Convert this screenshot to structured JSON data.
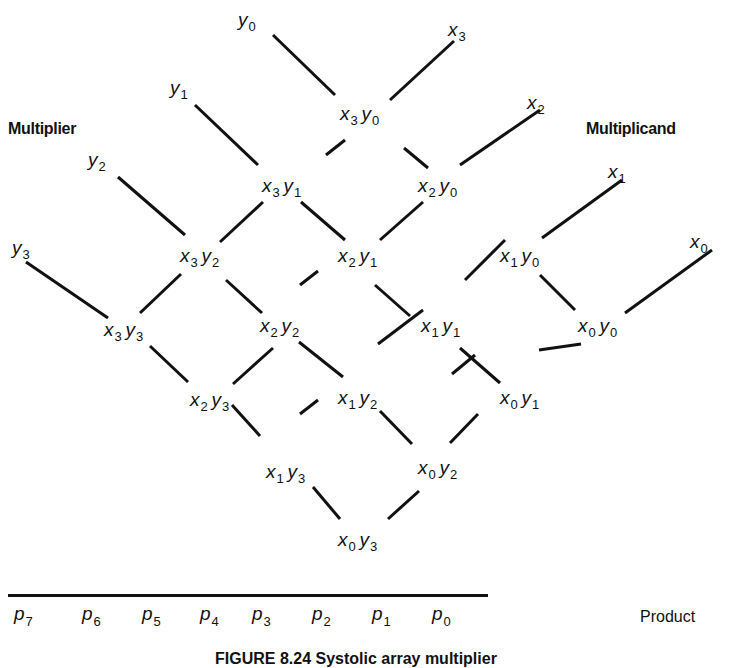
{
  "labels": {
    "multiplier": "Multiplier",
    "multiplicand": "Multiplicand",
    "product": "Product"
  },
  "caption": "FIGURE 8.24  Systolic array multiplier",
  "inputs_y": [
    {
      "base": "y",
      "sub": "0",
      "x": 238,
      "y": 10
    },
    {
      "base": "y",
      "sub": "1",
      "x": 170,
      "y": 78
    },
    {
      "base": "y",
      "sub": "2",
      "x": 88,
      "y": 150
    },
    {
      "base": "y",
      "sub": "3",
      "x": 12,
      "y": 238
    }
  ],
  "inputs_x": [
    {
      "base": "x",
      "sub": "3",
      "x": 448,
      "y": 20
    },
    {
      "base": "x",
      "sub": "2",
      "x": 527,
      "y": 93
    },
    {
      "base": "x",
      "sub": "1",
      "x": 608,
      "y": 162
    },
    {
      "base": "x",
      "sub": "0",
      "x": 690,
      "y": 232
    }
  ],
  "cells": [
    {
      "a": "3",
      "b": "0",
      "x": 340,
      "y": 104
    },
    {
      "a": "3",
      "b": "1",
      "x": 262,
      "y": 176
    },
    {
      "a": "2",
      "b": "0",
      "x": 418,
      "y": 176
    },
    {
      "a": "3",
      "b": "2",
      "x": 180,
      "y": 246
    },
    {
      "a": "2",
      "b": "1",
      "x": 338,
      "y": 246
    },
    {
      "a": "1",
      "b": "0",
      "x": 500,
      "y": 246
    },
    {
      "a": "3",
      "b": "3",
      "x": 104,
      "y": 320
    },
    {
      "a": "2",
      "b": "2",
      "x": 260,
      "y": 316
    },
    {
      "a": "1",
      "b": "1",
      "x": 421,
      "y": 316
    },
    {
      "a": "0",
      "b": "0",
      "x": 578,
      "y": 316
    },
    {
      "a": "2",
      "b": "3",
      "x": 190,
      "y": 390
    },
    {
      "a": "1",
      "b": "2",
      "x": 338,
      "y": 388
    },
    {
      "a": "0",
      "b": "1",
      "x": 500,
      "y": 388
    },
    {
      "a": "1",
      "b": "3",
      "x": 266,
      "y": 462
    },
    {
      "a": "0",
      "b": "2",
      "x": 418,
      "y": 458
    },
    {
      "a": "0",
      "b": "3",
      "x": 338,
      "y": 530
    }
  ],
  "product_bits": [
    {
      "base": "p",
      "sub": "7",
      "x": 14
    },
    {
      "base": "p",
      "sub": "6",
      "x": 82
    },
    {
      "base": "p",
      "sub": "5",
      "x": 142
    },
    {
      "base": "p",
      "sub": "4",
      "x": 200
    },
    {
      "base": "p",
      "sub": "3",
      "x": 252
    },
    {
      "base": "p",
      "sub": "2",
      "x": 312
    },
    {
      "base": "p",
      "sub": "1",
      "x": 372
    },
    {
      "base": "p",
      "sub": "0",
      "x": 432
    }
  ],
  "lines": [
    [
      273,
      35,
      335,
      95
    ],
    [
      454,
      41,
      390,
      100
    ],
    [
      195,
      105,
      258,
      165
    ],
    [
      540,
      110,
      460,
      165
    ],
    [
      301,
      202,
      345,
      240
    ],
    [
      404,
      148,
      428,
      168
    ],
    [
      118,
      177,
      185,
      235
    ],
    [
      622,
      180,
      542,
      238
    ],
    [
      26,
      262,
      108,
      318
    ],
    [
      263,
      202,
      220,
      242
    ],
    [
      345,
      140,
      326,
      155
    ],
    [
      423,
      202,
      380,
      240
    ],
    [
      375,
      285,
      410,
      316
    ],
    [
      465,
      280,
      505,
      240
    ],
    [
      540,
      275,
      575,
      310
    ],
    [
      712,
      250,
      625,
      313
    ],
    [
      140,
      313,
      181,
      274
    ],
    [
      226,
      280,
      262,
      313
    ],
    [
      299,
      342,
      343,
      377
    ],
    [
      300,
      285,
      318,
      271
    ],
    [
      460,
      348,
      500,
      383
    ],
    [
      378,
      344,
      423,
      310
    ],
    [
      539,
      350,
      581,
      344
    ],
    [
      150,
      346,
      188,
      382
    ],
    [
      233,
      384,
      273,
      348
    ],
    [
      452,
      374,
      475,
      355
    ],
    [
      232,
      405,
      260,
      436
    ],
    [
      300,
      414,
      318,
      400
    ],
    [
      380,
      411,
      412,
      444
    ],
    [
      450,
      443,
      478,
      414
    ],
    [
      313,
      487,
      340,
      519
    ],
    [
      388,
      519,
      419,
      491
    ]
  ]
}
